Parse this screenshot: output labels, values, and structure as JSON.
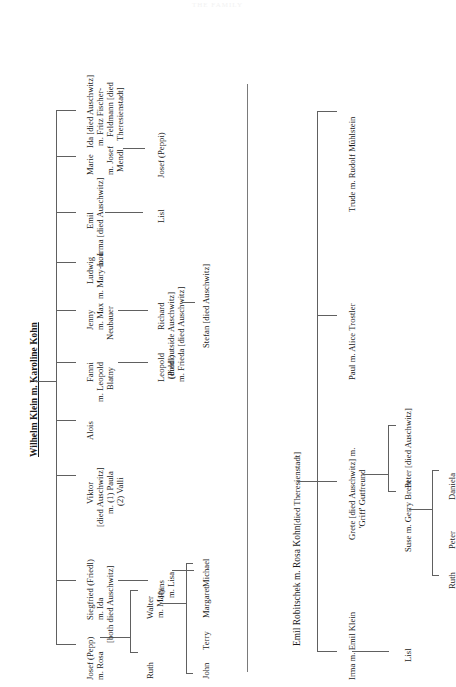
{
  "page": {
    "header_faint": "THE FAMILY",
    "width": 456,
    "height": 687,
    "ink_color": "#1a1a1a",
    "rule_color": "#606060"
  },
  "families": [
    {
      "id": "klein",
      "title": "Wilhelm Klein m. Karoline Kohn",
      "children": [
        {
          "id": "josef-pepp",
          "name_lines": [
            "Josef (Pepp)",
            "m. Rosa"
          ],
          "descendants": [
            {
              "id": "ruth-1",
              "name_lines": [
                "Ruth"
              ]
            },
            {
              "id": "walter",
              "name_lines": [
                "Walter",
                "m. Mary"
              ]
            }
          ],
          "grandchildren": [
            {
              "id": "john",
              "name_lines": [
                "John"
              ]
            },
            {
              "id": "terry",
              "name_lines": [
                "Terry"
              ]
            },
            {
              "id": "margaret",
              "name_lines": [
                "Margaret"
              ]
            }
          ]
        },
        {
          "id": "siegfried",
          "name_lines": [
            "Siegfried (Friedl)",
            "m. Ida",
            "[both died Auschwitz]"
          ],
          "descendants": [
            {
              "id": "hans",
              "name_lines": [
                "Hans",
                "m. Lisa"
              ]
            }
          ],
          "grandchildren": [
            {
              "id": "michael",
              "name_lines": [
                "Michael"
              ]
            }
          ]
        },
        {
          "id": "viktor",
          "name_lines": [
            "Viktor",
            "[died Auschwitz]",
            "m. (1) Paula",
            "(2) Valli"
          ],
          "descendants": [],
          "grandchildren": []
        },
        {
          "id": "alois",
          "name_lines": [
            "Alois"
          ],
          "descendants": [],
          "grandchildren": []
        },
        {
          "id": "fanni",
          "name_lines": [
            "Fanni",
            "m. Leopold",
            "Blatny"
          ],
          "descendants": [
            {
              "id": "leopold-poldl",
              "name_lines": [
                "Leopold",
                "(Poldl)"
              ]
            }
          ],
          "grandchildren": []
        },
        {
          "id": "jenny",
          "name_lines": [
            "Jenny",
            "m. Max",
            "Neubauer"
          ],
          "descendants": [
            {
              "id": "richard",
              "name_lines": [
                "Richard",
                "[died outside Auschwitz]",
                "m. Frieda [died Auschwitz]"
              ]
            }
          ],
          "grandchildren": [
            {
              "id": "stefan",
              "name_lines": [
                "Stefan [died Auschwitz]"
              ]
            }
          ]
        },
        {
          "id": "ludwig",
          "name_lines": [
            "Ludwig",
            "m. Mary-Lou"
          ],
          "descendants": [],
          "grandchildren": []
        },
        {
          "id": "emil",
          "name_lines": [
            "Emil",
            "m. Irma [died Auschwitz]"
          ],
          "descendants": [
            {
              "id": "lisl-1",
              "name_lines": [
                "Lisl"
              ]
            }
          ],
          "grandchildren": []
        },
        {
          "id": "marie",
          "name_lines": [
            "Marie",
            "m. Josef",
            "Mendl"
          ],
          "descendants": [
            {
              "id": "josef-peppi",
              "name_lines": [
                "Josef (Peppi)"
              ]
            }
          ],
          "grandchildren": []
        },
        {
          "id": "ida",
          "name_lines": [
            "Ida [died Auschwitz]",
            "m. Fritz Fischer-",
            "Feldmann [died",
            "Theresienstadt]"
          ],
          "descendants": [],
          "grandchildren": []
        }
      ]
    },
    {
      "id": "robitschek",
      "title": "Emil Robitschek m. Rosa Kohn",
      "title_suffix": " [died Theresienstadt]",
      "children": [
        {
          "id": "irma",
          "name_lines": [
            "Irma m. Emil Klein"
          ],
          "descendants": [
            {
              "id": "lisl-2",
              "name_lines": [
                "Lisl"
              ]
            }
          ],
          "grandchildren": []
        },
        {
          "id": "grete",
          "name_lines": [
            "Grete [died Auschwitz] m.",
            "'Griff' Gutfreund"
          ],
          "descendants": [
            {
              "id": "suse",
              "name_lines": [
                "Suse m. Gerry Brent"
              ]
            },
            {
              "id": "peter-d",
              "name_lines": [
                "Peter [died Auschwitz]"
              ]
            }
          ],
          "grandchildren": [
            {
              "id": "ruth-2",
              "name_lines": [
                "Ruth"
              ]
            },
            {
              "id": "peter-2",
              "name_lines": [
                "Peter"
              ]
            },
            {
              "id": "daniela",
              "name_lines": [
                "Daniela"
              ]
            }
          ]
        },
        {
          "id": "paul",
          "name_lines": [
            "Paul m. Alice Trostler"
          ],
          "descendants": [],
          "grandchildren": []
        },
        {
          "id": "trude",
          "name_lines": [
            "Trude m. Rudolf Mühlstein"
          ],
          "descendants": [],
          "grandchildren": []
        }
      ]
    }
  ],
  "labels": {
    "klein_title": "Wilhelm Klein m. Karoline Kohn",
    "robitschek_title": "Emil Robitschek m. Rosa Kohn",
    "robitschek_title_suffix": "[died Theresienstadt]",
    "josef_pepp_1": "Josef (Pepp)",
    "josef_pepp_2": "m. Rosa",
    "ruth_1": "Ruth",
    "walter_1": "Walter",
    "walter_2": "m. Mary",
    "john": "John",
    "terry": "Terry",
    "margaret": "Margaret",
    "siegfried_1": "Siegfried (Friedl)",
    "siegfried_2": "m. Ida",
    "siegfried_3": "[both died Auschwitz]",
    "hans_1": "Hans",
    "hans_2": "m. Lisa",
    "michael": "Michael",
    "viktor_1": "Viktor",
    "viktor_2": "[died Auschwitz]",
    "viktor_3": "m. (1) Paula",
    "viktor_4": "(2) Valli",
    "alois": "Alois",
    "fanni_1": "Fanni",
    "fanni_2": "m. Leopold",
    "fanni_3": "Blatny",
    "leopold_1": "Leopold",
    "leopold_2": "(Poldl)",
    "jenny_1": "Jenny",
    "jenny_2": "m. Max",
    "jenny_3": "Neubauer",
    "richard_1": "Richard",
    "richard_2": "[died outside Auschwitz]",
    "richard_3": "m. Frieda [died Auschwitz]",
    "stefan": "Stefan [died Auschwitz]",
    "ludwig_1": "Ludwig",
    "ludwig_2": "m. Mary-Lou",
    "emil_1": "Emil",
    "emil_2": "m. Irma [died Auschwitz]",
    "lisl_1": "Lisl",
    "marie_1": "Marie",
    "marie_2": "m. Josef",
    "marie_3": "Mendl",
    "josef_peppi": "Josef (Peppi)",
    "ida_1": "Ida [died Auschwitz]",
    "ida_2": "m. Fritz Fischer-",
    "ida_3": "Feldmann [died",
    "ida_4": "Theresienstadt]",
    "irma_klein": "Irma m. Emil Klein",
    "lisl_2": "Lisl",
    "grete_1": "Grete [died Auschwitz] m.",
    "grete_2": "'Griff' Gutfreund",
    "suse": "Suse m. Gerry Brent",
    "peter_died": "Peter [died Auschwitz]",
    "ruth_2": "Ruth",
    "peter_2": "Peter",
    "daniela": "Daniela",
    "paul": "Paul m. Alice Trostler",
    "trude": "Trude m. Rudolf Mühlstein"
  }
}
